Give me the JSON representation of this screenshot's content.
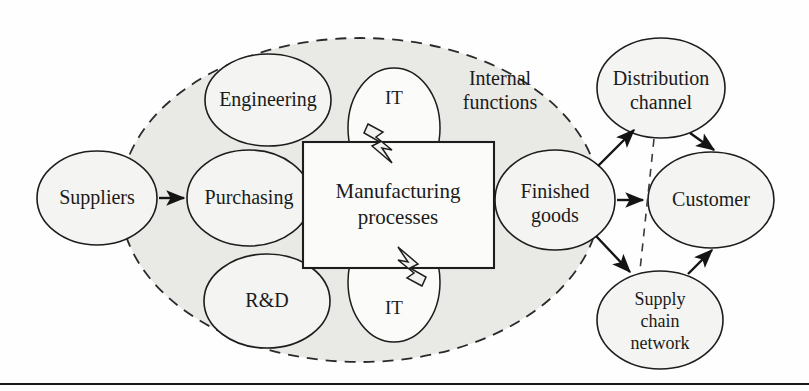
{
  "diagram": {
    "nodes": [
      {
        "id": "suppliers",
        "label": "Suppliers",
        "shape": "ellipse",
        "cx": 97,
        "cy": 198,
        "rx": 60,
        "ry": 47,
        "font_size": 20
      },
      {
        "id": "purchasing",
        "label": "Purchasing",
        "shape": "ellipse",
        "cx": 249,
        "cy": 198,
        "rx": 62,
        "ry": 48,
        "font_size": 20
      },
      {
        "id": "engineering",
        "label": "Engineering",
        "shape": "ellipse",
        "cx": 268,
        "cy": 100,
        "rx": 63,
        "ry": 46,
        "font_size": 20
      },
      {
        "id": "rnd",
        "label": "R&D",
        "shape": "ellipse",
        "cx": 267,
        "cy": 301,
        "rx": 63,
        "ry": 47,
        "font_size": 20
      },
      {
        "id": "manufacturing",
        "label": "Manufacturing\nprocesses",
        "shape": "rect",
        "x": 303,
        "y": 142,
        "w": 191,
        "h": 126,
        "font_size": 21
      },
      {
        "id": "finished",
        "label": "Finished\ngoods",
        "shape": "ellipse",
        "cx": 555,
        "cy": 200,
        "rx": 60,
        "ry": 50,
        "font_size": 20
      },
      {
        "id": "distribution",
        "label": "Distribution\nchannel",
        "shape": "ellipse",
        "cx": 661,
        "cy": 88,
        "rx": 64,
        "ry": 50,
        "font_size": 20
      },
      {
        "id": "customer",
        "label": "Customer",
        "shape": "ellipse",
        "cx": 711,
        "cy": 200,
        "rx": 63,
        "ry": 48,
        "font_size": 20
      },
      {
        "id": "supplychain",
        "label": "Supply\nchain\nnetwork",
        "shape": "ellipse",
        "cx": 660,
        "cy": 320,
        "rx": 63,
        "ry": 49,
        "font_size": 18
      },
      {
        "id": "it_top",
        "label": "IT",
        "shape": "ellipse",
        "cx": 394,
        "cy": 128,
        "rx": 46,
        "ry": 60,
        "font_size": 19
      },
      {
        "id": "it_bottom",
        "label": "IT",
        "shape": "ellipse",
        "cx": 394,
        "cy": 282,
        "rx": 46,
        "ry": 60,
        "font_size": 19
      }
    ],
    "region_label": "Internal\nfunctions",
    "region_label_pos": {
      "x": 500,
      "y": 88
    },
    "boundary": {
      "name": "internal-functions-boundary",
      "cx": 360,
      "cy": 200,
      "rx": 240,
      "ry": 162,
      "style": "dashed"
    },
    "arrows": [
      {
        "id": "suppliers-to-purchasing",
        "from": "Suppliers",
        "to": "Purchasing",
        "style": "solid"
      },
      {
        "id": "finished-to-distribution",
        "from": "Finished goods",
        "to": "Distribution channel",
        "style": "solid"
      },
      {
        "id": "finished-to-customer",
        "from": "Finished goods",
        "to": "Customer",
        "style": "solid"
      },
      {
        "id": "finished-to-supplychain",
        "from": "Finished goods",
        "to": "Supply chain network",
        "style": "solid"
      },
      {
        "id": "distribution-to-customer",
        "from": "Distribution channel",
        "to": "Customer",
        "style": "solid"
      },
      {
        "id": "supplychain-to-customer",
        "from": "Supply chain network",
        "to": "Customer",
        "style": "solid"
      },
      {
        "id": "distribution-to-supplychain-dashed",
        "from": "Distribution channel",
        "to": "Supply chain network",
        "style": "dashed"
      }
    ],
    "bolts": [
      {
        "id": "it-bolt-top",
        "points": "IT enables manufacturing processes (top)"
      },
      {
        "id": "it-bolt-bottom",
        "points": "IT enables manufacturing processes (bottom)"
      }
    ],
    "colors": {
      "shaded_region": "#e9e9e6",
      "node_fill": "#f4f4f2",
      "stroke": "#1d1d1d",
      "page_background": "#ffffff",
      "rule": "#1a1a1a"
    }
  }
}
